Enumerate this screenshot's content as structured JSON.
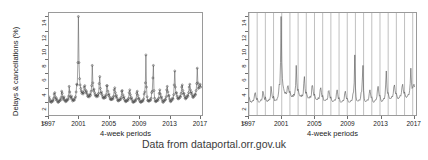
{
  "caption": "Data from dataportal.orr.gov.uk",
  "panels": [
    {
      "id": "left",
      "ylabel": "Delays & cancellations (%)",
      "xlabel": "4-week periods",
      "yticks": [
        "0",
        "2",
        "4",
        "6",
        "8",
        "10",
        "12",
        "14"
      ],
      "xticks": [
        "1997",
        "2001",
        "2005",
        "2009",
        "2013",
        "2017"
      ],
      "markers": true,
      "gridlines": false
    },
    {
      "id": "right",
      "ylabel": "",
      "xlabel": "4-week periods",
      "yticks": [
        "0",
        "2",
        "4",
        "6",
        "8",
        "10",
        "12",
        "14"
      ],
      "xticks": [
        "1997",
        "2001",
        "2005",
        "2009",
        "2013",
        "2017"
      ],
      "markers": false,
      "gridlines": true
    }
  ],
  "chart_data": {
    "type": "line",
    "title": "",
    "subtitle": "",
    "xlabel": "4-week periods",
    "ylabel": "Delays & cancellations (%)",
    "xlim": [
      1997.0,
      2017.4
    ],
    "ylim": [
      0,
      14.6
    ],
    "ytick_values": [
      0,
      2,
      4,
      6,
      8,
      10,
      12,
      14
    ],
    "xtick_values": [
      1997,
      2001,
      2005,
      2009,
      2013,
      2017
    ],
    "grid": "vertical gridlines at each year, right panel only",
    "legend": "none",
    "annotations": [
      "Data from dataportal.orr.gov.uk"
    ],
    "series": [
      {
        "name": "Delays & cancellations (%)",
        "marker": "open circle (left panel only)",
        "color": "#555555",
        "x": [
          1997.0,
          1997.08,
          1997.15,
          1997.23,
          1997.31,
          1997.38,
          1997.46,
          1997.54,
          1997.62,
          1997.69,
          1997.77,
          1997.85,
          1997.92,
          1998.0,
          1998.08,
          1998.15,
          1998.23,
          1998.31,
          1998.38,
          1998.46,
          1998.54,
          1998.62,
          1998.69,
          1998.77,
          1998.85,
          1998.92,
          1999.0,
          1999.08,
          1999.15,
          1999.23,
          1999.31,
          1999.38,
          1999.46,
          1999.54,
          1999.62,
          1999.69,
          1999.77,
          1999.85,
          1999.92,
          2000.0,
          2000.08,
          2000.15,
          2000.23,
          2000.31,
          2000.38,
          2000.46,
          2000.54,
          2000.62,
          2000.69,
          2000.77,
          2000.85,
          2000.92,
          2001.0,
          2001.08,
          2001.15,
          2001.23,
          2001.31,
          2001.38,
          2001.46,
          2001.54,
          2001.62,
          2001.69,
          2001.77,
          2001.85,
          2001.92,
          2002.0,
          2002.08,
          2002.15,
          2002.23,
          2002.31,
          2002.38,
          2002.46,
          2002.54,
          2002.62,
          2002.69,
          2002.77,
          2002.85,
          2002.92,
          2003.0,
          2003.08,
          2003.15,
          2003.23,
          2003.31,
          2003.38,
          2003.46,
          2003.54,
          2003.62,
          2003.69,
          2003.77,
          2003.85,
          2003.92,
          2004.0,
          2004.08,
          2004.15,
          2004.23,
          2004.31,
          2004.38,
          2004.46,
          2004.54,
          2004.62,
          2004.69,
          2004.77,
          2004.85,
          2004.92,
          2005.0,
          2005.08,
          2005.15,
          2005.23,
          2005.31,
          2005.38,
          2005.46,
          2005.54,
          2005.62,
          2005.69,
          2005.77,
          2005.85,
          2005.92,
          2006.0,
          2006.08,
          2006.15,
          2006.23,
          2006.31,
          2006.38,
          2006.46,
          2006.54,
          2006.62,
          2006.69,
          2006.77,
          2006.85,
          2006.92,
          2007.0,
          2007.08,
          2007.15,
          2007.23,
          2007.31,
          2007.38,
          2007.46,
          2007.54,
          2007.62,
          2007.69,
          2007.77,
          2007.85,
          2007.92,
          2008.0,
          2008.08,
          2008.15,
          2008.23,
          2008.31,
          2008.38,
          2008.46,
          2008.54,
          2008.62,
          2008.69,
          2008.77,
          2008.85,
          2008.92,
          2009.0,
          2009.08,
          2009.15,
          2009.23,
          2009.31,
          2009.38,
          2009.46,
          2009.54,
          2009.62,
          2009.69,
          2009.77,
          2009.85,
          2009.92,
          2010.0,
          2010.08,
          2010.15,
          2010.23,
          2010.31,
          2010.38,
          2010.46,
          2010.54,
          2010.62,
          2010.69,
          2010.77,
          2010.85,
          2010.92,
          2011.0,
          2011.08,
          2011.15,
          2011.23,
          2011.31,
          2011.38,
          2011.46,
          2011.54,
          2011.62,
          2011.69,
          2011.77,
          2011.85,
          2011.92,
          2012.0,
          2012.08,
          2012.15,
          2012.23,
          2012.31,
          2012.38,
          2012.46,
          2012.54,
          2012.62,
          2012.69,
          2012.77,
          2012.85,
          2012.92,
          2013.0,
          2013.08,
          2013.15,
          2013.23,
          2013.31,
          2013.38,
          2013.46,
          2013.54,
          2013.62,
          2013.69,
          2013.77,
          2013.85,
          2013.92,
          2014.0,
          2014.08,
          2014.15,
          2014.23,
          2014.31,
          2014.38,
          2014.46,
          2014.54,
          2014.62,
          2014.69,
          2014.77,
          2014.85,
          2014.92,
          2015.0,
          2015.08,
          2015.15,
          2015.23,
          2015.31,
          2015.38,
          2015.46,
          2015.54,
          2015.62,
          2015.69,
          2015.77,
          2015.85,
          2015.92,
          2016.0,
          2016.08,
          2016.15,
          2016.23,
          2016.31,
          2016.38,
          2016.46,
          2016.54,
          2016.62,
          2016.69,
          2016.77,
          2016.85,
          2016.92,
          2017.0,
          2017.08,
          2017.15,
          2017.23
        ],
        "y": [
          2.6,
          2.3,
          1.9,
          2.0,
          1.8,
          1.9,
          2.1,
          2.0,
          2.4,
          3.0,
          3.2,
          2.6,
          2.2,
          2.4,
          2.1,
          1.9,
          1.8,
          1.9,
          2.0,
          2.2,
          2.1,
          2.5,
          3.4,
          3.1,
          2.5,
          2.2,
          2.6,
          2.2,
          2.0,
          1.9,
          2.1,
          2.0,
          2.3,
          2.2,
          2.7,
          4.1,
          3.3,
          2.6,
          2.4,
          2.7,
          2.3,
          2.0,
          2.1,
          2.2,
          2.1,
          2.4,
          2.6,
          3.3,
          4.4,
          4.3,
          7.5,
          14.1,
          7.5,
          5.2,
          4.3,
          3.8,
          3.4,
          3.1,
          3.3,
          3.0,
          3.2,
          4.0,
          4.2,
          3.6,
          3.2,
          3.4,
          3.0,
          2.7,
          2.6,
          2.8,
          2.6,
          3.0,
          2.8,
          3.4,
          4.2,
          7.1,
          4.6,
          3.5,
          3.7,
          3.2,
          2.9,
          2.7,
          2.8,
          2.6,
          2.9,
          2.7,
          3.1,
          4.5,
          5.5,
          3.8,
          3.1,
          3.3,
          2.9,
          2.6,
          2.4,
          2.5,
          2.4,
          2.7,
          2.5,
          2.9,
          4.2,
          4.2,
          3.4,
          2.8,
          3.0,
          2.6,
          2.3,
          2.2,
          2.3,
          2.2,
          2.5,
          2.3,
          2.7,
          3.6,
          3.9,
          3.2,
          2.6,
          2.8,
          2.4,
          2.1,
          2.0,
          2.1,
          2.1,
          2.3,
          2.2,
          2.5,
          3.4,
          3.5,
          2.9,
          2.4,
          2.6,
          2.2,
          2.0,
          1.9,
          2.0,
          2.0,
          2.2,
          2.1,
          2.4,
          3.2,
          3.6,
          2.9,
          2.3,
          2.5,
          2.2,
          1.9,
          1.8,
          1.9,
          1.9,
          2.1,
          2.0,
          2.3,
          3.1,
          3.4,
          2.8,
          2.3,
          2.4,
          2.1,
          1.9,
          1.8,
          1.9,
          1.9,
          2.1,
          2.0,
          2.3,
          3.0,
          3.3,
          4.6,
          8.6,
          4.0,
          2.6,
          2.1,
          2.0,
          2.0,
          2.0,
          2.2,
          2.1,
          2.4,
          3.2,
          3.4,
          5.3,
          7.1,
          3.5,
          2.4,
          2.0,
          1.9,
          2.0,
          2.0,
          2.2,
          2.1,
          2.4,
          3.1,
          3.6,
          3.0,
          2.5,
          2.6,
          2.2,
          1.9,
          1.8,
          2.0,
          2.0,
          2.2,
          2.2,
          2.6,
          3.6,
          4.1,
          3.3,
          2.7,
          2.8,
          2.3,
          2.0,
          1.9,
          2.1,
          2.1,
          2.4,
          2.3,
          2.9,
          4.3,
          6.3,
          4.0,
          3.1,
          3.2,
          2.7,
          2.4,
          2.3,
          2.4,
          2.4,
          2.7,
          2.6,
          3.1,
          4.0,
          4.3,
          3.5,
          3.0,
          3.1,
          2.7,
          2.4,
          2.3,
          2.5,
          2.5,
          2.8,
          2.7,
          3.2,
          4.0,
          4.4,
          3.6,
          3.1,
          3.3,
          2.9,
          2.6,
          2.5,
          2.7,
          2.7,
          3.0,
          2.9,
          3.5,
          4.5,
          6.7,
          4.6,
          3.8,
          3.9,
          4.2,
          4.4,
          4.0
        ]
      }
    ]
  }
}
